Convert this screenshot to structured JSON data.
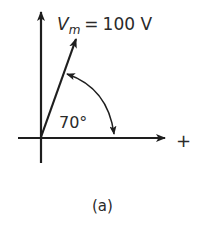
{
  "diagram": {
    "type": "phasor-diagram",
    "phasor": {
      "symbol": "V",
      "subscript": "m",
      "equals": "=",
      "magnitude": "100 V",
      "angle_label": "70°",
      "angle_degrees": 70
    },
    "axis": {
      "positive_sign": "+"
    },
    "caption": "(a)",
    "colors": {
      "stroke": "#1e1e1e",
      "text": "#2a2a2a",
      "background": "#ffffff"
    }
  }
}
